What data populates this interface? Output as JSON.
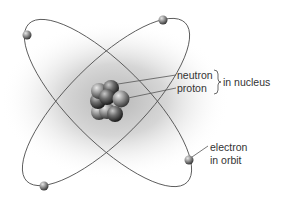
{
  "diagram": {
    "labels": {
      "neutron": "neutron",
      "proton": "proton",
      "nucleus": "in nucleus",
      "electron_line1": "electron",
      "electron_line2": "in orbit"
    },
    "colors": {
      "orbit": "#555555",
      "text": "#333333",
      "glow": "#bdbdbd"
    },
    "electron_count": 4
  }
}
